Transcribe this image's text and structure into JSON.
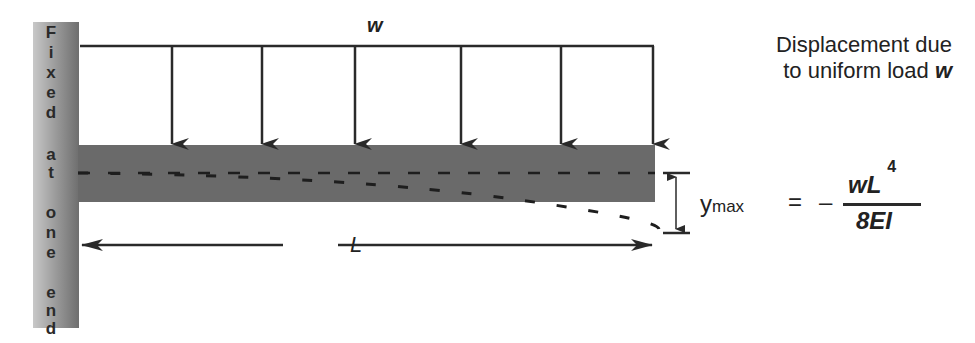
{
  "diagram": {
    "title_line1": "Displacement due",
    "title_line2_prefix": "to uniform load ",
    "title_line2_symbol": "w",
    "load_label": "w",
    "length_label": "L",
    "wall_label_letters": [
      "F",
      "i",
      "x",
      "e",
      "d",
      "a",
      "t",
      "o",
      "n",
      "e",
      "e",
      "n",
      "d"
    ],
    "wall_label_text": "Fixed at one end",
    "formula": {
      "lhs": "y",
      "lhs_subscript": "max",
      "equals": "=",
      "sign": "–",
      "numerator": "wL",
      "numerator_exponent": "4",
      "denominator": "8EI"
    },
    "load_arrow_count": 6,
    "colors": {
      "beam": "#6a6a6a",
      "wall": "#8a8a8a",
      "line": "#2a2a2a",
      "background": "#ffffff"
    }
  }
}
